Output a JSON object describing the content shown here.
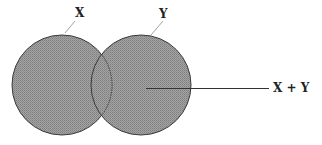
{
  "diagram": {
    "type": "venn",
    "labels": {
      "set_a": "X",
      "set_b": "Y",
      "union": "X + Y"
    },
    "colors": {
      "fill": "#9b9b9b",
      "fill_dither": "#7e7e7e",
      "outline": "#3a3a3a",
      "leader": "#8a8a8a",
      "pointer": "#333333",
      "text": "#222222"
    },
    "circles": [
      {
        "name": "X",
        "cx": 62,
        "cy": 85,
        "r": 50
      },
      {
        "name": "Y",
        "cx": 141,
        "cy": 85,
        "r": 50
      }
    ]
  }
}
